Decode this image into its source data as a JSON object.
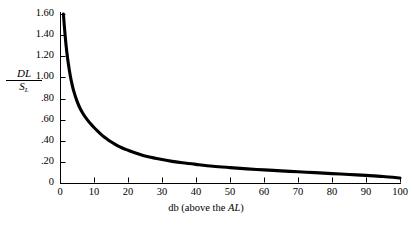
{
  "chart_data": {
    "type": "line",
    "title": "",
    "xlabel": "db (above the AL)",
    "xlabel_parts": {
      "prefix": "db (above the ",
      "italic": "AL",
      "suffix": ")"
    },
    "ylabel": "DL/SL",
    "ylabel_parts": {
      "numerator": "DL",
      "denominator": "S",
      "denominator_subscript": "L"
    },
    "xlim": [
      0,
      100
    ],
    "ylim": [
      0,
      1.6
    ],
    "grid": false,
    "legend": null,
    "xticks": [
      0,
      10,
      20,
      30,
      40,
      50,
      60,
      70,
      80,
      90,
      100
    ],
    "xtick_labels": [
      "0",
      "10",
      "20",
      "30",
      "40",
      "50",
      "60",
      "70",
      "80",
      "90",
      "100"
    ],
    "yticks": [
      0,
      0.2,
      0.4,
      0.6,
      0.8,
      1.0,
      1.2,
      1.4,
      1.6
    ],
    "ytick_labels": [
      "0",
      ".20",
      ".40",
      ".60",
      ".80",
      "1.00",
      "1.20",
      "1.40",
      "1.60"
    ],
    "series": [
      {
        "name": "DL/SL vs db above AL",
        "color": "#000000",
        "line_width": 3.1,
        "x": [
          1,
          1.5,
          2,
          2.5,
          3,
          3.5,
          4,
          5,
          6,
          7,
          8,
          9,
          10,
          11,
          12,
          13,
          14,
          15,
          16,
          17,
          18,
          19,
          20,
          22,
          24,
          26,
          28,
          30,
          33,
          36,
          40,
          45,
          50,
          55,
          60,
          65,
          70,
          75,
          80,
          85,
          90,
          95,
          100
        ],
        "y": [
          1.6,
          1.4,
          1.24,
          1.12,
          1.02,
          0.94,
          0.875,
          0.775,
          0.7,
          0.645,
          0.6,
          0.56,
          0.525,
          0.493,
          0.463,
          0.436,
          0.412,
          0.39,
          0.37,
          0.352,
          0.336,
          0.322,
          0.31,
          0.286,
          0.266,
          0.249,
          0.235,
          0.222,
          0.205,
          0.191,
          0.176,
          0.159,
          0.146,
          0.134,
          0.124,
          0.115,
          0.106,
          0.098,
          0.089,
          0.081,
          0.072,
          0.062,
          0.048
        ]
      }
    ],
    "axis_color": "#000000",
    "background": "#ffffff"
  },
  "geometry": {
    "plot_left": 60,
    "plot_right": 400,
    "plot_bottom": 183,
    "plot_top": 14
  }
}
